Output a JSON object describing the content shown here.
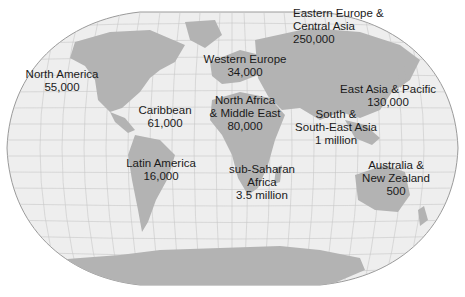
{
  "map": {
    "type": "world-map",
    "projection": "Winkel tripel (curved outline)",
    "colors": {
      "ocean": "#eeeeee",
      "land": "#b3b3b3",
      "graticule": "#c8c8c8",
      "outline": "#9a9a9a",
      "text": "#1a1a1a"
    },
    "regions": [
      {
        "name": "North America",
        "value": "55,000",
        "lines": [
          "North America",
          "55,000"
        ]
      },
      {
        "name": "Caribbean",
        "value": "61,000",
        "lines": [
          "Caribbean",
          "61,000"
        ]
      },
      {
        "name": "Latin America",
        "value": "16,000",
        "lines": [
          "Latin America",
          "16,000"
        ]
      },
      {
        "name": "Western Europe",
        "value": "34,000",
        "lines": [
          "Western Europe",
          "34,000"
        ]
      },
      {
        "name": "North Africa & Middle East",
        "value": "80,000",
        "lines": [
          "North Africa",
          "& Middle East",
          "80,000"
        ]
      },
      {
        "name": "sub-Saharan Africa",
        "value": "3.5 million",
        "lines": [
          "sub-Saharan",
          "Africa",
          "3.5 million"
        ]
      },
      {
        "name": "Eastern Europe & Central Asia",
        "value": "250,000",
        "lines": [
          "Eastern Europe &",
          "Central Asia",
          "250,000"
        ]
      },
      {
        "name": "East Asia & Pacific",
        "value": "130,000",
        "lines": [
          "East Asia & Pacific",
          "130,000"
        ]
      },
      {
        "name": "South & South-East Asia",
        "value": "1 million",
        "lines": [
          "South &",
          "South-East Asia",
          "1 million"
        ]
      },
      {
        "name": "Australia & New Zealand",
        "value": "500",
        "lines": [
          "Australia &",
          "New Zealand",
          "500"
        ]
      }
    ]
  }
}
